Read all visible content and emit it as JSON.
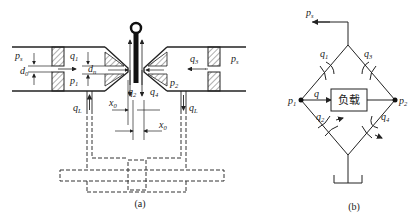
{
  "figure": {
    "panel_a": {
      "caption": "(a)",
      "labels": {
        "ps_left": "p",
        "ps_left_sub": "s",
        "ps_right": "p",
        "ps_right_sub": "s",
        "d0": "d",
        "d0_sub": "0",
        "q1": "q",
        "q1_sub": "1",
        "dn": "d",
        "dn_sub": "n",
        "p1": "p",
        "p1_sub": "1",
        "q2": "q",
        "q2_sub": "2",
        "q3": "q",
        "q3_sub": "3",
        "q4": "q",
        "q4_sub": "4",
        "p2": "p",
        "p2_sub": "2",
        "qL_left": "q",
        "qL_left_sub": "L",
        "qL_right": "q",
        "qL_right_sub": "L",
        "x0_left": "x",
        "x0_left_sub": "0",
        "x0_right": "x",
        "x0_right_sub": "0"
      }
    },
    "panel_b": {
      "caption": "(b)",
      "load_label": "负载",
      "labels": {
        "ps": "p",
        "ps_sub": "s",
        "q1": "q",
        "q1_sub": "1",
        "q3": "q",
        "q3_sub": "3",
        "q": "q",
        "p1": "p",
        "p1_sub": "1",
        "p2": "p",
        "p2_sub": "2",
        "q2": "q",
        "q2_sub": "2",
        "q4": "q",
        "q4_sub": "4"
      }
    }
  }
}
